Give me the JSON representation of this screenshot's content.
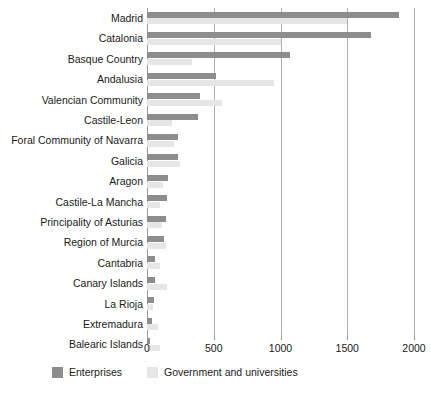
{
  "chart_data": {
    "type": "bar",
    "orientation": "horizontal",
    "title": "",
    "subtitle": "",
    "xlabel": "",
    "ylabel": "",
    "xlim": [
      0,
      2000
    ],
    "xticks": [
      0,
      500,
      1000,
      1500,
      2000
    ],
    "xtick_labels": [
      "0",
      "500",
      "1000",
      "1500",
      "2000"
    ],
    "grid": true,
    "grid_axis": "x",
    "legend_position": "bottom-left",
    "categories": [
      "Madrid",
      "Catalonia",
      "Basque Country",
      "Andalusia",
      "Valencian Community",
      "Castile-Leon",
      "Foral Community of Navarra",
      "Galicia",
      "Aragon",
      "Castile-La Mancha",
      "Principality of Asturias",
      "Region of Murcia",
      "Cantabria",
      "Canary Islands",
      "La Rioja",
      "Extremadura",
      "Balearic Islands"
    ],
    "series": [
      {
        "name": "Enterprises",
        "color": "#8d8d8d",
        "values": [
          1890,
          1680,
          1070,
          520,
          400,
          380,
          230,
          230,
          160,
          150,
          140,
          125,
          60,
          60,
          55,
          35,
          25
        ]
      },
      {
        "name": "Government and universities",
        "color": "#e6e6e6",
        "values": [
          1500,
          1000,
          340,
          950,
          560,
          190,
          200,
          250,
          120,
          95,
          110,
          140,
          95,
          150,
          45,
          85,
          100
        ]
      }
    ]
  },
  "legend": {
    "items": [
      {
        "label": "Enterprises",
        "color": "#8d8d8d"
      },
      {
        "label": "Government and universities",
        "color": "#e6e6e6"
      }
    ]
  }
}
